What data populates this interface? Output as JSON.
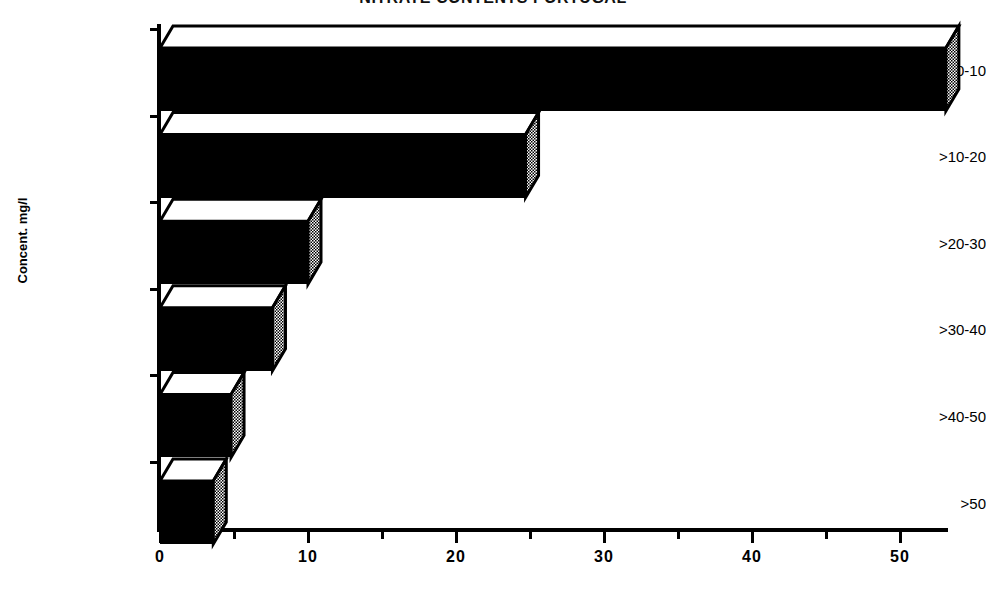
{
  "chart_data": {
    "type": "bar",
    "orientation": "horizontal",
    "style": "3d-bar",
    "title": "NITRATE CONTENTS PORTUGAL",
    "title_visible_fragment": "NTENTS PORTUGAL",
    "xlabel": "",
    "ylabel": "Concent. mg/l",
    "categories": [
      "0-10",
      ">10-20",
      ">20-30",
      ">30-40",
      ">40-50",
      ">50"
    ],
    "values": [
      53.1,
      24.7,
      10.0,
      7.6,
      4.8,
      3.6
    ],
    "xlim": [
      0,
      54
    ],
    "ylim": null,
    "xticks": [
      0,
      10,
      20,
      30,
      40,
      50
    ],
    "xtick_labels": [
      "0",
      "10",
      "20",
      "30",
      "40",
      "50"
    ],
    "xticks_minor": [
      5,
      15,
      25,
      35,
      45
    ],
    "grid": false,
    "legend": null,
    "series": [
      {
        "name": "Percentage of samples",
        "values": [
          53.1,
          24.7,
          10.0,
          7.6,
          4.8,
          3.6
        ]
      }
    ],
    "colors": {
      "bar_front": "#000000",
      "bar_top": "#ffffff",
      "bar_side": "#808080",
      "axis": "#000000",
      "background": "#ffffff"
    }
  },
  "axes": {
    "y_axis_title": "Concent. mg/l",
    "y_tick_labels": [
      "0-10",
      ">10-20",
      ">20-30",
      ">30-40",
      ">40-50",
      ">50"
    ],
    "x_tick_labels": [
      "0",
      "10",
      "20",
      "30",
      "40",
      "50"
    ]
  },
  "header": {
    "title": "NITRATE CONTENTS PORTUGAL"
  }
}
